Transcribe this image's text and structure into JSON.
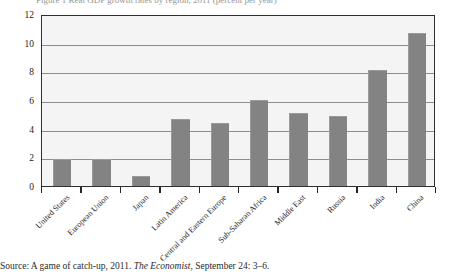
{
  "top_caption": "Figure 1  Real GDP growth rates by region, 2011 (percent per year)",
  "source": {
    "prefix": "Source: A game of catch-up, 2011. ",
    "publication": "The Economist",
    "suffix": ", September 24: 3–6."
  },
  "colors": {
    "bar_fill": "#838383",
    "plot_background": "#f4f4f4",
    "gridline": "#8c8c8c",
    "frame_border": "#2e2e2e",
    "text": "#1e1e1e"
  },
  "chart_data": {
    "type": "bar",
    "title": "",
    "xlabel": "",
    "ylabel": "",
    "ylim": [
      0,
      12
    ],
    "yticks": [
      0,
      2,
      4,
      6,
      8,
      10,
      12
    ],
    "ytick_labels": [
      "0",
      "2",
      "4",
      "6",
      "8",
      "10",
      "12"
    ],
    "grid": true,
    "legend": false,
    "x_label_rotation": -45,
    "categories": [
      "United States",
      "European Union",
      "Japan",
      "Latin America",
      "Central and Eastern Europe",
      "Sub-Saharan Africa",
      "Middle East",
      "Russia",
      "India",
      "China"
    ],
    "values": [
      1.8,
      1.8,
      0.6,
      4.6,
      4.3,
      5.9,
      5.0,
      4.8,
      8.0,
      10.6
    ]
  }
}
